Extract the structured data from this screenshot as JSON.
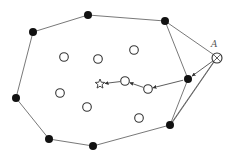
{
  "diagram": {
    "width": 232,
    "height": 160,
    "colors": {
      "line": "#555555",
      "filled": "#111111",
      "open_stroke": "#333333",
      "background": "#ffffff"
    },
    "label_A": "A",
    "hull_polygon": [
      [
        33,
        32
      ],
      [
        88,
        15
      ],
      [
        165,
        21
      ],
      [
        217,
        57
      ],
      [
        170,
        125
      ],
      [
        93,
        146
      ],
      [
        49,
        139
      ],
      [
        16,
        98
      ]
    ],
    "inner_chain": [
      [
        165,
        21
      ],
      [
        188,
        79
      ],
      [
        170,
        125
      ]
    ],
    "filled_points": [
      [
        33,
        32
      ],
      [
        88,
        15
      ],
      [
        165,
        21
      ],
      [
        188,
        79
      ],
      [
        170,
        125
      ],
      [
        93,
        146
      ],
      [
        49,
        139
      ],
      [
        16,
        98
      ]
    ],
    "open_points": [
      [
        64,
        57
      ],
      [
        98,
        59
      ],
      [
        134,
        50
      ],
      [
        60,
        93
      ],
      [
        87,
        107
      ],
      [
        125,
        81
      ],
      [
        148,
        89
      ],
      [
        139,
        118
      ]
    ],
    "star_point": [
      100,
      84
    ],
    "point_A": [
      217,
      58
    ],
    "arrow_path": [
      [
        217,
        58
      ],
      [
        188,
        79
      ],
      [
        148,
        89
      ],
      [
        125,
        81
      ],
      [
        100,
        84
      ]
    ]
  }
}
